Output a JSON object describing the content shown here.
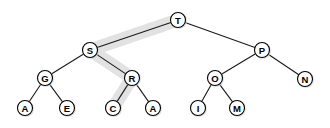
{
  "figure": {
    "type": "binary-search-tree-diagram",
    "background_color": "#ffffff",
    "node_fill": "#ffffff",
    "node_stroke": "#000000",
    "edge_color": "#1a1a1a",
    "highlight_color": "#e2e2e2",
    "node_radius": 7.5,
    "highlight_width": 13
  },
  "highlight": {
    "name": "search-path-highlight",
    "description": "grey band tracing path",
    "path_nodes": [
      "T",
      "S",
      "R",
      "C"
    ],
    "points": [
      {
        "x": 178,
        "y": 20
      },
      {
        "x": 90,
        "y": 50
      },
      {
        "x": 132,
        "y": 78
      },
      {
        "x": 113,
        "y": 108
      }
    ]
  },
  "nodes": [
    {
      "id": "T",
      "label": "T",
      "x": 178,
      "y": 20,
      "level": 0,
      "highlighted": true
    },
    {
      "id": "S",
      "label": "S",
      "x": 90,
      "y": 50,
      "level": 1,
      "highlighted": true
    },
    {
      "id": "P",
      "label": "P",
      "x": 262,
      "y": 50,
      "level": 1,
      "highlighted": false
    },
    {
      "id": "G",
      "label": "G",
      "x": 45,
      "y": 78,
      "level": 2,
      "highlighted": false
    },
    {
      "id": "R",
      "label": "R",
      "x": 132,
      "y": 78,
      "level": 2,
      "highlighted": true
    },
    {
      "id": "O",
      "label": "O",
      "x": 215,
      "y": 78,
      "level": 2,
      "highlighted": false
    },
    {
      "id": "N",
      "label": "N",
      "x": 305,
      "y": 79,
      "level": 2,
      "highlighted": false
    },
    {
      "id": "A1",
      "label": "A",
      "x": 25,
      "y": 108,
      "level": 3,
      "highlighted": false
    },
    {
      "id": "E",
      "label": "E",
      "x": 67,
      "y": 108,
      "level": 3,
      "highlighted": false
    },
    {
      "id": "C",
      "label": "C",
      "x": 113,
      "y": 108,
      "level": 3,
      "highlighted": true
    },
    {
      "id": "A2",
      "label": "A",
      "x": 153,
      "y": 108,
      "level": 3,
      "highlighted": false
    },
    {
      "id": "I",
      "label": "I",
      "x": 198,
      "y": 108,
      "level": 3,
      "highlighted": false
    },
    {
      "id": "M",
      "label": "M",
      "x": 237,
      "y": 108,
      "level": 3,
      "highlighted": false
    }
  ],
  "edges": [
    {
      "from": "T",
      "to": "S",
      "side": "left"
    },
    {
      "from": "T",
      "to": "P",
      "side": "right"
    },
    {
      "from": "S",
      "to": "G",
      "side": "left"
    },
    {
      "from": "S",
      "to": "R",
      "side": "right"
    },
    {
      "from": "P",
      "to": "O",
      "side": "left"
    },
    {
      "from": "P",
      "to": "N",
      "side": "right"
    },
    {
      "from": "G",
      "to": "A1",
      "side": "left"
    },
    {
      "from": "G",
      "to": "E",
      "side": "right"
    },
    {
      "from": "R",
      "to": "C",
      "side": "left"
    },
    {
      "from": "R",
      "to": "A2",
      "side": "right"
    },
    {
      "from": "O",
      "to": "I",
      "side": "left"
    },
    {
      "from": "O",
      "to": "M",
      "side": "right"
    }
  ]
}
